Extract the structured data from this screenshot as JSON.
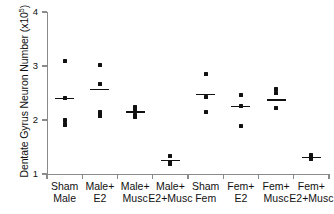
{
  "chart_data": {
    "type": "scatter",
    "title": "",
    "xlabel": "",
    "ylabel": "Dentate Gyrus Neuron Number (x10",
    "ylabel_exponent": "5",
    "ylabel_suffix": ")",
    "ylim": [
      1,
      4
    ],
    "yticks": [
      1,
      2,
      3,
      4
    ],
    "ytick_labels": [
      "1",
      "2",
      "3",
      "4"
    ],
    "grid": false,
    "legend": "none",
    "marker": "square",
    "marker_color": "#111111",
    "mean_marker": "horizontal-line",
    "axis_color": "#8a8a8a",
    "categories": [
      {
        "line1": "Sham",
        "line2": "Male"
      },
      {
        "line1": "Male+",
        "line2": "E2"
      },
      {
        "line1": "Male+",
        "line2": "Musc"
      },
      {
        "line1": "Male+",
        "line2": "E2+Musc"
      },
      {
        "line1": "Sham",
        "line2": "Fem"
      },
      {
        "line1": "Fem+",
        "line2": "E2"
      },
      {
        "line1": "Fem+",
        "line2": "Musc"
      },
      {
        "line1": "Fem+",
        "line2": "E2+Musc"
      }
    ],
    "series": [
      {
        "name": "Sham Male",
        "points": [
          3.1,
          2.4,
          2.0,
          1.93,
          1.9
        ],
        "mean": 2.4
      },
      {
        "name": "Male+E2",
        "points": [
          3.01,
          2.67,
          2.15,
          2.11,
          2.08
        ],
        "mean": 2.57
      },
      {
        "name": "Male+Musc",
        "points": [
          2.24,
          2.2,
          2.09,
          2.05
        ],
        "mean": 2.15
      },
      {
        "name": "Male+E2+Musc",
        "points": [
          1.34,
          1.22,
          1.18
        ],
        "mean": 1.25
      },
      {
        "name": "Sham Fem",
        "points": [
          2.85,
          2.42,
          2.15
        ],
        "mean": 2.47
      },
      {
        "name": "Fem+E2",
        "points": [
          2.47,
          2.26,
          1.89
        ],
        "mean": 2.25
      },
      {
        "name": "Fem+Musc",
        "points": [
          2.58,
          2.5,
          2.22
        ],
        "mean": 2.37
      },
      {
        "name": "Fem+E2+Musc",
        "points": [
          1.35,
          1.31,
          1.27
        ],
        "mean": 1.31
      }
    ]
  }
}
